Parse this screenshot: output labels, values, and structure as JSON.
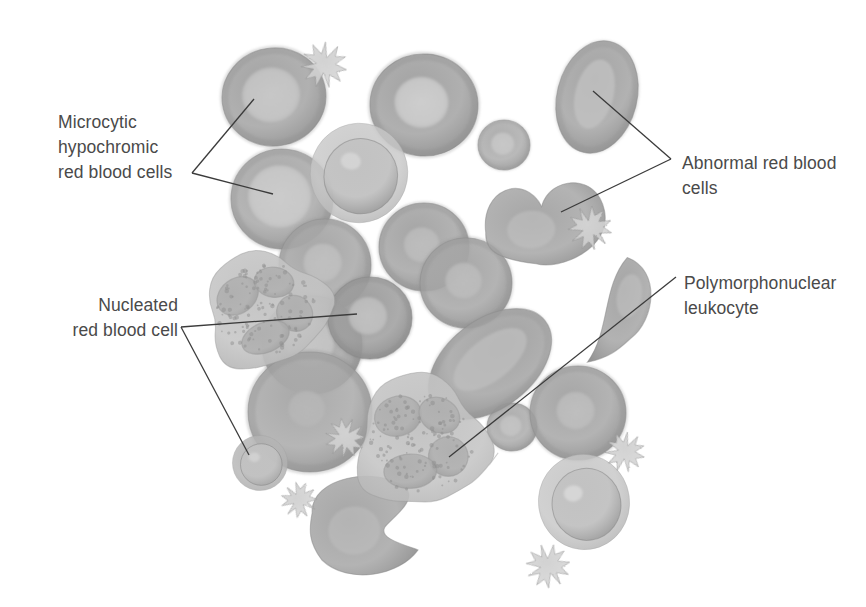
{
  "figure": {
    "background_color": "#ffffff",
    "width": 866,
    "height": 607,
    "style": "grayscale medical airbrush illustration",
    "text_color": "#4a4a4a",
    "leader_line_color": "#3b3b3b"
  },
  "labels": [
    {
      "id": "microcytic-hypochromic",
      "lines": [
        "Microcytic",
        "hypochromic",
        "red blood cells"
      ],
      "align": "left",
      "x": 58,
      "y": 110,
      "leader_vertex": [
        192,
        173
      ],
      "targets": [
        [
          254,
          99
        ],
        [
          273,
          194
        ]
      ]
    },
    {
      "id": "abnormal-red-blood-cells",
      "lines": [
        "Abnormal red blood",
        "cells"
      ],
      "align": "left",
      "x": 682,
      "y": 151,
      "leader_vertex": [
        671,
        159
      ],
      "targets": [
        [
          593,
          91
        ],
        [
          561,
          212
        ]
      ]
    },
    {
      "id": "nucleated-red-blood-cell",
      "lines": [
        "Nucleated",
        "red blood cell"
      ],
      "align": "right",
      "x": 178,
      "y": 293,
      "leader_vertex": [
        181,
        327
      ],
      "targets": [
        [
          357,
          314
        ],
        [
          249,
          455
        ]
      ]
    },
    {
      "id": "polymorphonuclear-leukocyte",
      "lines": [
        "Polymorphonuclear",
        "leukocyte"
      ],
      "align": "left",
      "x": 684,
      "y": 271,
      "leader_vertex": [
        676,
        277
      ],
      "targets": [
        [
          449,
          457
        ]
      ]
    }
  ],
  "cells": [
    {
      "name": "microcytic-hypochromic-rbc-upper",
      "type": "hypochromic-rbc",
      "cx": 274,
      "cy": 97,
      "rx": 52,
      "ry": 49,
      "rot": -8,
      "rim": "#8d8d8d",
      "body": "#a3a3a3",
      "pallor": "#cbcbcb",
      "pallor_scale": 0.56
    },
    {
      "name": "microcytic-hypochromic-rbc-lower",
      "type": "hypochromic-rbc",
      "cx": 282,
      "cy": 199,
      "rx": 51,
      "ry": 50,
      "rot": 5,
      "rim": "#8f8f8f",
      "body": "#a8a8a8",
      "pallor": "#cfcfcf",
      "pallor_scale": 0.62
    },
    {
      "name": "normocytic-rbc-top-center",
      "type": "hypochromic-rbc",
      "cx": 424,
      "cy": 105,
      "rx": 54,
      "ry": 51,
      "rot": 4,
      "rim": "#8b8b8b",
      "body": "#a2a2a2",
      "pallor": "#d2d2d2",
      "pallor_scale": 0.5
    },
    {
      "name": "small-rbc-center-right",
      "type": "hypochromic-rbc",
      "cx": 504,
      "cy": 145,
      "rx": 26,
      "ry": 25,
      "rot": 0,
      "rim": "#959595",
      "body": "#adadad",
      "pallor": "#cacaca",
      "pallor_scale": 0.45
    },
    {
      "name": "nucleated-rbc-upper",
      "type": "nucleated-rbc",
      "cx": 359,
      "cy": 173,
      "rx": 46,
      "ry": 47,
      "rot": 10,
      "cyto": "#c8c8c8",
      "nucleus": "#8a8a8a",
      "highlight": "#d9d9d9"
    },
    {
      "name": "rbc-pair-left",
      "type": "hypochromic-rbc",
      "cx": 424,
      "cy": 247,
      "rx": 45,
      "ry": 44,
      "rot": 0,
      "rim": "#8d8d8d",
      "body": "#a5a5a5",
      "pallor": "#bfbfbf",
      "pallor_scale": 0.4
    },
    {
      "name": "rbc-pair-right",
      "type": "hypochromic-rbc",
      "cx": 466,
      "cy": 283,
      "rx": 46,
      "ry": 45,
      "rot": 0,
      "rim": "#8d8d8d",
      "body": "#a6a6a6",
      "pallor": "#bebebe",
      "pallor_scale": 0.4
    },
    {
      "name": "rbc-left-mid",
      "type": "hypochromic-rbc",
      "cx": 325,
      "cy": 265,
      "rx": 46,
      "ry": 46,
      "rot": 0,
      "rim": "#8e8e8e",
      "body": "#a7a7a7",
      "pallor": "#c2c2c2",
      "pallor_scale": 0.42
    },
    {
      "name": "rbc-left-lower",
      "type": "hypochromic-rbc",
      "cx": 312,
      "cy": 345,
      "rx": 50,
      "ry": 49,
      "rot": 0,
      "rim": "#8c8c8c",
      "body": "#a4a4a4",
      "pallor": "#c9c9c9",
      "pallor_scale": 0.5
    },
    {
      "name": "target-rbc-center",
      "type": "hypochromic-rbc",
      "cx": 370,
      "cy": 318,
      "rx": 42,
      "ry": 41,
      "rot": 0,
      "rim": "#888888",
      "body": "#9d9d9d",
      "pallor": "#c4c4c4",
      "pallor_scale": 0.46
    },
    {
      "name": "large-rbc-center-left",
      "type": "hypochromic-rbc",
      "cx": 310,
      "cy": 412,
      "rx": 62,
      "ry": 60,
      "rot": 0,
      "rim": "#8f8f8f",
      "body": "#a9a9a9",
      "pallor": "#b8b8b8",
      "pallor_scale": 0.3
    },
    {
      "name": "nucleated-rbc-small-lower-left",
      "type": "nucleated-rbc",
      "cx": 260,
      "cy": 463,
      "rx": 26,
      "ry": 26,
      "rot": 0,
      "cyto": "#b4b4b4",
      "nucleus": "#9a9a9a",
      "highlight": "#d6d6d6"
    },
    {
      "name": "small-rbc-center-lower",
      "type": "hypochromic-rbc",
      "cx": 512,
      "cy": 427,
      "rx": 25,
      "ry": 24,
      "rot": 0,
      "rim": "#949494",
      "body": "#acacac",
      "pallor": "#c6c6c6",
      "pallor_scale": 0.44
    },
    {
      "name": "rbc-right-lower",
      "type": "hypochromic-rbc",
      "cx": 578,
      "cy": 413,
      "rx": 48,
      "ry": 47,
      "rot": 0,
      "rim": "#8d8d8d",
      "body": "#a6a6a6",
      "pallor": "#c0c0c0",
      "pallor_scale": 0.4
    },
    {
      "name": "nucleated-rbc-lower-right",
      "type": "nucleated-rbc",
      "cx": 584,
      "cy": 502,
      "rx": 43,
      "ry": 45,
      "rot": -8,
      "cyto": "#c6c6c6",
      "nucleus": "#8d8d8d",
      "highlight": "#dcdcdc"
    },
    {
      "name": "abnormal-rbc-elliptocyte-top-right",
      "type": "elliptocyte",
      "cx": 597,
      "cy": 97,
      "rx": 40,
      "ry": 57,
      "rot": 14,
      "rim": "#8b8b8b",
      "body": "#a4a4a4",
      "pallor": "#c3c3c3"
    },
    {
      "name": "abnormal-rbc-knizocyte",
      "type": "knizocyte",
      "cx": 545,
      "cy": 220,
      "w": 120,
      "h": 86,
      "rot": -4,
      "rim": "#8b8b8b",
      "body": "#a6a6a6",
      "pallor": "#c2c2c2"
    },
    {
      "name": "teardrop-rbc-right",
      "type": "teardrop",
      "cx": 625,
      "cy": 313,
      "w": 62,
      "h": 110,
      "rot": 10,
      "rim": "#8b8b8b",
      "body": "#a5a5a5",
      "pallor": "#c1c1c1"
    },
    {
      "name": "macro-ovalocyte-center",
      "type": "elliptocyte",
      "cx": 490,
      "cy": 364,
      "rx": 44,
      "ry": 70,
      "rot": 52,
      "rim": "#8b8b8b",
      "body": "#a3a3a3",
      "pallor": "#bfbfbf"
    },
    {
      "name": "helmet-cell-bottom",
      "type": "helmet",
      "cx": 368,
      "cy": 525,
      "w": 118,
      "h": 100,
      "rot": -6,
      "rim": "#8b8b8b",
      "body": "#a6a6a6",
      "pallor": "#c2c2c2"
    },
    {
      "name": "polymorphonuclear-leukocyte-upper",
      "type": "leukocyte",
      "cx": 266,
      "cy": 310,
      "rx": 62,
      "ry": 58,
      "rot": -12,
      "cyto": "#c4c4c4",
      "nucleus": "#9b9b9b",
      "granules": "#8f8f8f"
    },
    {
      "name": "polymorphonuclear-leukocyte-lower",
      "type": "leukocyte",
      "cx": 421,
      "cy": 442,
      "rx": 66,
      "ry": 66,
      "rot": 8,
      "cyto": "#c3c3c3",
      "nucleus": "#9a9a9a",
      "granules": "#8e8e8e"
    },
    {
      "name": "platelet-top",
      "type": "platelet",
      "cx": 324,
      "cy": 65,
      "r": 23,
      "rot": 12,
      "body": "#bcbcbc",
      "edge": "#8f8f8f"
    },
    {
      "name": "platelet-right",
      "type": "platelet",
      "cx": 590,
      "cy": 228,
      "r": 22,
      "rot": -20,
      "body": "#bababa",
      "edge": "#8d8d8d"
    },
    {
      "name": "platelet-center-lower",
      "type": "platelet",
      "cx": 345,
      "cy": 438,
      "r": 20,
      "rot": 30,
      "body": "#bdbdbd",
      "edge": "#909090"
    },
    {
      "name": "platelet-near-helmet",
      "type": "platelet",
      "cx": 299,
      "cy": 500,
      "r": 18,
      "rot": -35,
      "body": "#bfbfbf",
      "edge": "#929292"
    },
    {
      "name": "platelet-right-lower",
      "type": "platelet",
      "cx": 625,
      "cy": 452,
      "r": 20,
      "rot": 15,
      "body": "#bbbbbb",
      "edge": "#8e8e8e"
    },
    {
      "name": "platelet-bottom-right",
      "type": "platelet",
      "cx": 548,
      "cy": 566,
      "r": 22,
      "rot": -10,
      "body": "#bcbcbc",
      "edge": "#8f8f8f"
    }
  ]
}
